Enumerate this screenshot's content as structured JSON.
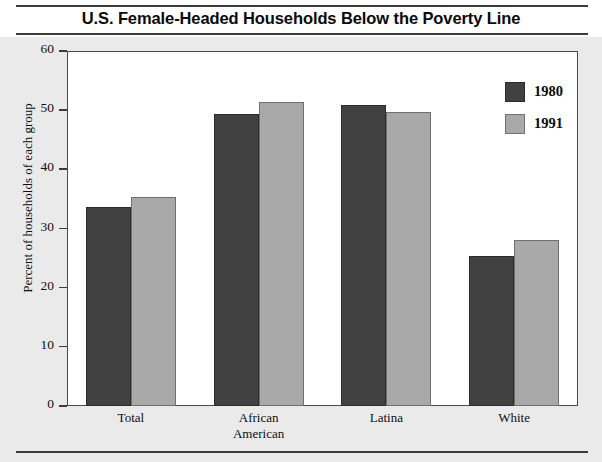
{
  "figure": {
    "title": "U.S. Female-Headed Households Below the Poverty Line"
  },
  "legend": {
    "items": [
      {
        "label": "1980",
        "color": "#414141"
      },
      {
        "label": "1991",
        "color": "#a9a9a9"
      }
    ]
  },
  "axes": {
    "ylabel": "Percent of households of each group",
    "yticks": [
      "0",
      "10",
      "20",
      "30",
      "40",
      "50",
      "60"
    ]
  },
  "chart_data": {
    "type": "bar",
    "title": "U.S. Female-Headed Households Below the Poverty Line",
    "xlabel": "",
    "ylabel": "Percent of households of each group",
    "ylim": [
      0,
      60
    ],
    "ytick_values": [
      0,
      10,
      20,
      30,
      40,
      50,
      60
    ],
    "grid": false,
    "legend_position": "top-right-inside",
    "categories": [
      "Total",
      "African American",
      "Latina",
      "White"
    ],
    "category_label_lines": [
      [
        "Total"
      ],
      [
        "African",
        "American"
      ],
      [
        "Latina"
      ],
      [
        "White"
      ]
    ],
    "series": [
      {
        "name": "1980",
        "color": "#414141",
        "values": [
          33.6,
          49.4,
          50.9,
          25.3
        ]
      },
      {
        "name": "1991",
        "color": "#a9a9a9",
        "values": [
          35.4,
          51.4,
          49.7,
          28.0
        ]
      }
    ]
  }
}
